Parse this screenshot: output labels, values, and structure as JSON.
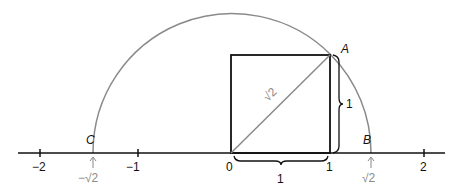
{
  "diagram": {
    "number_line": {
      "ticks": [
        {
          "value": -2,
          "label": "−2"
        },
        {
          "value": -1,
          "label": "−1"
        },
        {
          "value": 0,
          "label": "0"
        },
        {
          "value": 1,
          "label": "1"
        },
        {
          "value": 2,
          "label": "2"
        }
      ]
    },
    "square": {
      "side_label_bottom": "1",
      "side_label_right": "1",
      "diagonal_label": "√2"
    },
    "points": {
      "A": "A",
      "B": "B",
      "C": "C"
    },
    "arrow_labels": {
      "pos_sqrt2": "√2",
      "neg_sqrt2": "−√2"
    },
    "colors": {
      "line": "#111111",
      "arc": "#8a8a8a",
      "diagonal": "#8a8a8a",
      "arrow_label": "#888888"
    }
  }
}
